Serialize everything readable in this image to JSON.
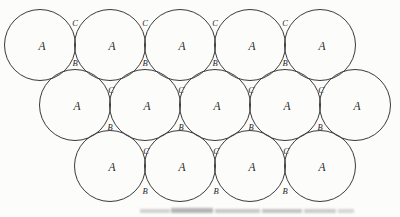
{
  "figure": {
    "colors": {
      "background": "#fcfcfa",
      "line": "#3a3a3a",
      "text": "#1e1e1e",
      "artifact": "#9d9d9d"
    },
    "circle_radius": 35.5,
    "circles": [
      {
        "x": 40,
        "y": 45,
        "label": "A"
      },
      {
        "x": 110,
        "y": 45,
        "label": "A"
      },
      {
        "x": 180,
        "y": 45,
        "label": "A"
      },
      {
        "x": 250,
        "y": 45,
        "label": "A"
      },
      {
        "x": 320,
        "y": 45,
        "label": "A"
      },
      {
        "x": 75,
        "y": 105,
        "label": "A"
      },
      {
        "x": 145,
        "y": 105,
        "label": "A"
      },
      {
        "x": 215,
        "y": 105,
        "label": "A"
      },
      {
        "x": 285,
        "y": 105,
        "label": "A"
      },
      {
        "x": 355,
        "y": 105,
        "label": "A"
      },
      {
        "x": 110,
        "y": 166,
        "label": "A"
      },
      {
        "x": 180,
        "y": 166,
        "label": "A"
      },
      {
        "x": 250,
        "y": 166,
        "label": "A"
      },
      {
        "x": 320,
        "y": 166,
        "label": "A"
      }
    ],
    "void_labels": [
      {
        "x": 75,
        "y": 23,
        "text": "C"
      },
      {
        "x": 145,
        "y": 23,
        "text": "C"
      },
      {
        "x": 215,
        "y": 23,
        "text": "C"
      },
      {
        "x": 285,
        "y": 23,
        "text": "C"
      },
      {
        "x": 75,
        "y": 63,
        "text": "B"
      },
      {
        "x": 145,
        "y": 63,
        "text": "B"
      },
      {
        "x": 215,
        "y": 63,
        "text": "B"
      },
      {
        "x": 285,
        "y": 63,
        "text": "B"
      },
      {
        "x": 111,
        "y": 90,
        "text": "C"
      },
      {
        "x": 181,
        "y": 90,
        "text": "C"
      },
      {
        "x": 251,
        "y": 90,
        "text": "C"
      },
      {
        "x": 321,
        "y": 90,
        "text": "C"
      },
      {
        "x": 110,
        "y": 127,
        "text": "B"
      },
      {
        "x": 181,
        "y": 127,
        "text": "B"
      },
      {
        "x": 251,
        "y": 127,
        "text": "B"
      },
      {
        "x": 320,
        "y": 127,
        "text": "B"
      },
      {
        "x": 146,
        "y": 151,
        "text": "C"
      },
      {
        "x": 216,
        "y": 151,
        "text": "C"
      },
      {
        "x": 286,
        "y": 151,
        "text": "C"
      },
      {
        "x": 145,
        "y": 191,
        "text": "B"
      },
      {
        "x": 216,
        "y": 191,
        "text": "B"
      },
      {
        "x": 285,
        "y": 191,
        "text": "B"
      }
    ],
    "artifact_segments": [
      {
        "x": 140,
        "y": 209,
        "w": 30,
        "h": 4,
        "opacity": 0.45
      },
      {
        "x": 171,
        "y": 208,
        "w": 42,
        "h": 5,
        "opacity": 0.75
      },
      {
        "x": 215,
        "y": 209,
        "w": 45,
        "h": 4,
        "opacity": 0.55
      },
      {
        "x": 262,
        "y": 209,
        "w": 40,
        "h": 4,
        "opacity": 0.6
      },
      {
        "x": 304,
        "y": 209,
        "w": 32,
        "h": 4,
        "opacity": 0.5
      },
      {
        "x": 338,
        "y": 209,
        "w": 16,
        "h": 4,
        "opacity": 0.4
      }
    ]
  }
}
